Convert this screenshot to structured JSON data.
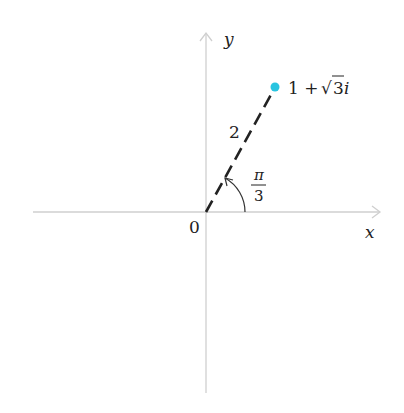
{
  "diagram": {
    "type": "complex-plane",
    "axes": {
      "x_label": "x",
      "y_label": "y",
      "origin_label": "0",
      "color": "#c8c8c8"
    },
    "point": {
      "label_main": "1 + ",
      "label_sqrt": "√",
      "label_radicand": "3",
      "label_i": "i",
      "color": "#29c4e0"
    },
    "segment": {
      "length_label": "2",
      "style": "dashed",
      "color": "#222222"
    },
    "angle": {
      "numerator": "π",
      "denominator": "3"
    }
  }
}
